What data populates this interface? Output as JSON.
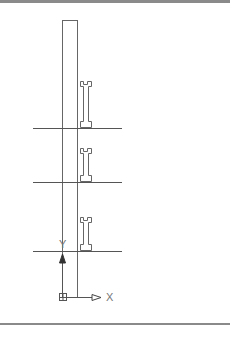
{
  "drawing": {
    "type": "cad-elevation",
    "column": {
      "x": 62,
      "y": 20,
      "width": 15,
      "bottom": 297
    },
    "floor_lines": [
      {
        "y": 128,
        "x1": 33,
        "x2": 122
      },
      {
        "y": 182,
        "x1": 33,
        "x2": 122
      },
      {
        "y": 251,
        "x1": 33,
        "x2": 122
      }
    ],
    "i_beams": [
      {
        "x": 80,
        "top": 81,
        "bottom": 127
      },
      {
        "x": 80,
        "top": 148,
        "bottom": 181
      },
      {
        "x": 80,
        "top": 217,
        "bottom": 250
      }
    ],
    "ucs": {
      "origin_x": 62,
      "origin_y": 297,
      "x_label": "X",
      "y_label": "Y"
    },
    "colors": {
      "line": "#555555",
      "frame": "#8a8a8a"
    }
  }
}
